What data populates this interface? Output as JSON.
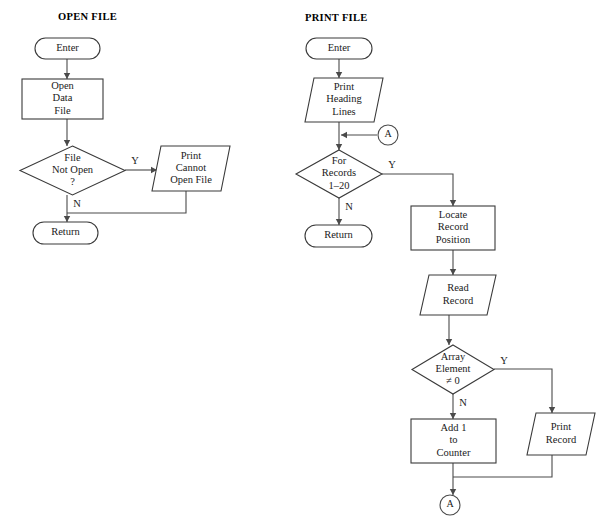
{
  "page": {
    "background_color": "#ffffff",
    "line_color": "#4a4a4a",
    "shape_fill": "#ffffff",
    "text_color": "#1a1a1a",
    "width": 609,
    "height": 528
  },
  "diagram_type": "flowchart",
  "charts": [
    {
      "id": "open-file",
      "title": "OPEN FILE",
      "title_x": 58,
      "title_y": 18,
      "nodes": [
        {
          "id": "of-enter",
          "name": "terminator-enter",
          "shape": "terminator",
          "label": "Enter",
          "lines": [
            "Enter"
          ],
          "x": 35,
          "y": 38,
          "w": 65,
          "h": 21
        },
        {
          "id": "of-open-data-file",
          "name": "process-open-data-file",
          "shape": "process",
          "label": "Open Data File",
          "lines": [
            "Open",
            "Data",
            "File"
          ],
          "x": 22,
          "y": 79,
          "w": 81,
          "h": 40
        },
        {
          "id": "of-file-not-open",
          "name": "decision-file-not-open",
          "shape": "decision",
          "label": "File Not Open ?",
          "lines": [
            "File",
            "Not Open",
            "?"
          ],
          "x": 20,
          "y": 146,
          "w": 105,
          "h": 49
        },
        {
          "id": "of-print-cannot-open",
          "name": "io-print-cannot-open-file",
          "shape": "io",
          "label": "Print Cannot Open File",
          "lines": [
            "Print",
            "Cannot",
            "Open File"
          ],
          "x": 152,
          "y": 146,
          "w": 60,
          "h": 45,
          "skew": 9
        },
        {
          "id": "of-return",
          "name": "terminator-return",
          "shape": "terminator",
          "label": "Return",
          "lines": [
            "Return"
          ],
          "x": 33,
          "y": 222,
          "w": 65,
          "h": 22
        }
      ],
      "edges": [
        {
          "id": "of-e1",
          "name": "edge-enter-to-open",
          "points": "67,59 67,79",
          "arrow": "down"
        },
        {
          "id": "of-e2",
          "name": "edge-open-to-decision",
          "points": "67,119 67,146",
          "arrow": "down"
        },
        {
          "id": "of-e3",
          "name": "edge-decision-yes-to-print",
          "points": "125,170 157,170",
          "arrow": "right"
        },
        {
          "id": "of-e4",
          "name": "edge-print-to-join",
          "points": "186,191 186,213 67,213",
          "arrow": "none"
        },
        {
          "id": "of-e5",
          "name": "edge-decision-no-to-return",
          "points": "67,195 67,222",
          "arrow": "down"
        }
      ],
      "branch_labels": [
        {
          "id": "of-y",
          "name": "branch-label-yes",
          "text": "Y",
          "x": 135,
          "y": 162
        },
        {
          "id": "of-n",
          "name": "branch-label-no",
          "text": "N",
          "x": 77,
          "y": 205
        }
      ],
      "connectors": []
    },
    {
      "id": "print-file",
      "title": "PRINT FILE",
      "title_x": 305,
      "title_y": 19,
      "nodes": [
        {
          "id": "pf-enter",
          "name": "terminator-enter",
          "shape": "terminator",
          "label": "Enter",
          "lines": [
            "Enter"
          ],
          "x": 306,
          "y": 38,
          "w": 66,
          "h": 21
        },
        {
          "id": "pf-print-heading",
          "name": "io-print-heading-lines",
          "shape": "io",
          "label": "Print Heading Lines",
          "lines": [
            "Print",
            "Heading",
            "Lines"
          ],
          "x": 305,
          "y": 78,
          "w": 60,
          "h": 44,
          "skew": 9
        },
        {
          "id": "pf-for-records",
          "name": "decision-for-records",
          "shape": "decision",
          "label": "For Records 1–20",
          "lines": [
            "For",
            "Records",
            "1–20"
          ],
          "x": 296,
          "y": 150,
          "w": 86,
          "h": 48
        },
        {
          "id": "pf-return",
          "name": "terminator-return",
          "shape": "terminator",
          "label": "Return",
          "lines": [
            "Return"
          ],
          "x": 305,
          "y": 225,
          "w": 67,
          "h": 22
        },
        {
          "id": "pf-locate-record",
          "name": "process-locate-record-position",
          "shape": "process",
          "label": "Locate Record Position",
          "lines": [
            "Locate",
            "Record",
            "Position"
          ],
          "x": 411,
          "y": 206,
          "w": 84,
          "h": 44
        },
        {
          "id": "pf-read-record",
          "name": "io-read-record",
          "shape": "io",
          "label": "Read Record",
          "lines": [
            "Read",
            "Record"
          ],
          "x": 420,
          "y": 275,
          "w": 58,
          "h": 40,
          "skew": 9
        },
        {
          "id": "pf-array-element",
          "name": "decision-array-element-nonzero",
          "shape": "decision",
          "label": "Array Element ≠ 0",
          "lines": [
            "Array",
            "Element",
            "≠ 0"
          ],
          "x": 412,
          "y": 345,
          "w": 82,
          "h": 49
        },
        {
          "id": "pf-add-counter",
          "name": "process-add-1-to-counter",
          "shape": "process",
          "label": "Add 1 to Counter",
          "lines": [
            "Add 1",
            "to",
            "Counter"
          ],
          "x": 411,
          "y": 419,
          "w": 85,
          "h": 44
        },
        {
          "id": "pf-print-record",
          "name": "io-print-record",
          "shape": "io",
          "label": "Print Record",
          "lines": [
            "Print",
            "Record"
          ],
          "x": 527,
          "y": 413,
          "w": 50,
          "h": 42,
          "skew": 9
        }
      ],
      "edges": [
        {
          "id": "pf-e1",
          "name": "edge-enter-to-heading",
          "points": "339,59 339,78",
          "arrow": "down"
        },
        {
          "id": "pf-e2",
          "name": "edge-heading-to-join-a",
          "points": "339,122 339,150",
          "arrow": "down"
        },
        {
          "id": "pf-e3",
          "name": "edge-connector-a-to-join",
          "points": "377,135 341,135",
          "arrow": "left"
        },
        {
          "id": "pf-e4",
          "name": "edge-records-yes-to-locate",
          "points": "382,174 453,174 453,206",
          "arrow": "down"
        },
        {
          "id": "pf-e5",
          "name": "edge-records-no-to-return",
          "points": "339,198 339,225",
          "arrow": "down"
        },
        {
          "id": "pf-e6",
          "name": "edge-locate-to-read",
          "points": "453,250 453,275",
          "arrow": "down"
        },
        {
          "id": "pf-e7",
          "name": "edge-read-to-array",
          "points": "449,315 449,345",
          "arrow": "down"
        },
        {
          "id": "pf-e8",
          "name": "edge-array-yes-to-print-record",
          "points": "494,369 552,369 552,413",
          "arrow": "down"
        },
        {
          "id": "pf-e9",
          "name": "edge-array-no-to-counter",
          "points": "453,394 453,419",
          "arrow": "down"
        },
        {
          "id": "pf-e10",
          "name": "edge-print-record-to-join",
          "points": "552,455 552,477 453,477",
          "arrow": "none"
        },
        {
          "id": "pf-e11",
          "name": "edge-counter-to-connector-a",
          "points": "453,463 453,495",
          "arrow": "down"
        }
      ],
      "branch_labels": [
        {
          "id": "pf-y1",
          "name": "branch-label-yes-records",
          "text": "Y",
          "x": 392,
          "y": 166
        },
        {
          "id": "pf-n1",
          "name": "branch-label-no-records",
          "text": "N",
          "x": 349,
          "y": 208
        },
        {
          "id": "pf-y2",
          "name": "branch-label-yes-array",
          "text": "Y",
          "x": 504,
          "y": 362
        },
        {
          "id": "pf-n2",
          "name": "branch-label-no-array",
          "text": "N",
          "x": 463,
          "y": 404
        }
      ],
      "connectors": [
        {
          "id": "pf-conn-a-top",
          "name": "connector-a-entry",
          "text": "A",
          "cx": 388,
          "cy": 135,
          "r": 10
        },
        {
          "id": "pf-conn-a-bottom",
          "name": "connector-a-exit",
          "text": "A",
          "cx": 450,
          "cy": 505,
          "r": 10
        }
      ]
    }
  ]
}
